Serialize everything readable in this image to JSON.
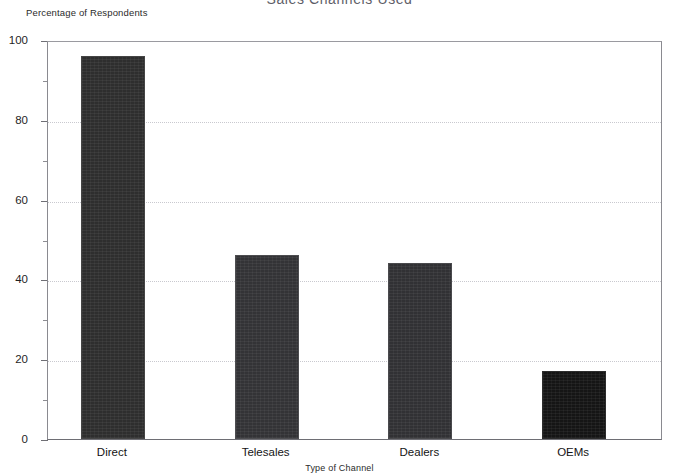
{
  "chart_data": {
    "type": "bar",
    "title": "Sales Channels Used",
    "xlabel": "Type of Channel",
    "ylabel": "Percentage of Respondents",
    "categories": [
      "Direct",
      "Telesales",
      "Dealers",
      "OEMs"
    ],
    "values": [
      96,
      46,
      44,
      17
    ],
    "series": [
      {
        "name": "Percentage of Respondents",
        "values": [
          96,
          46,
          44,
          17
        ]
      }
    ],
    "ylim": [
      0,
      100
    ],
    "y_ticks": [
      0,
      20,
      40,
      60,
      80,
      100
    ],
    "y_tick_labels": [
      "0",
      "20",
      "40",
      "60",
      "80",
      "100"
    ],
    "y_minor_ticks": [
      10,
      30,
      50,
      70,
      90
    ],
    "grid": true,
    "grid_axis": "y",
    "grid_style": "dotted",
    "legend": false,
    "bar_colors": [
      "#2e2e2e",
      "#333336",
      "#313134",
      "#151515"
    ],
    "background": "#ffffff",
    "axis_color": "#6f6f75"
  }
}
